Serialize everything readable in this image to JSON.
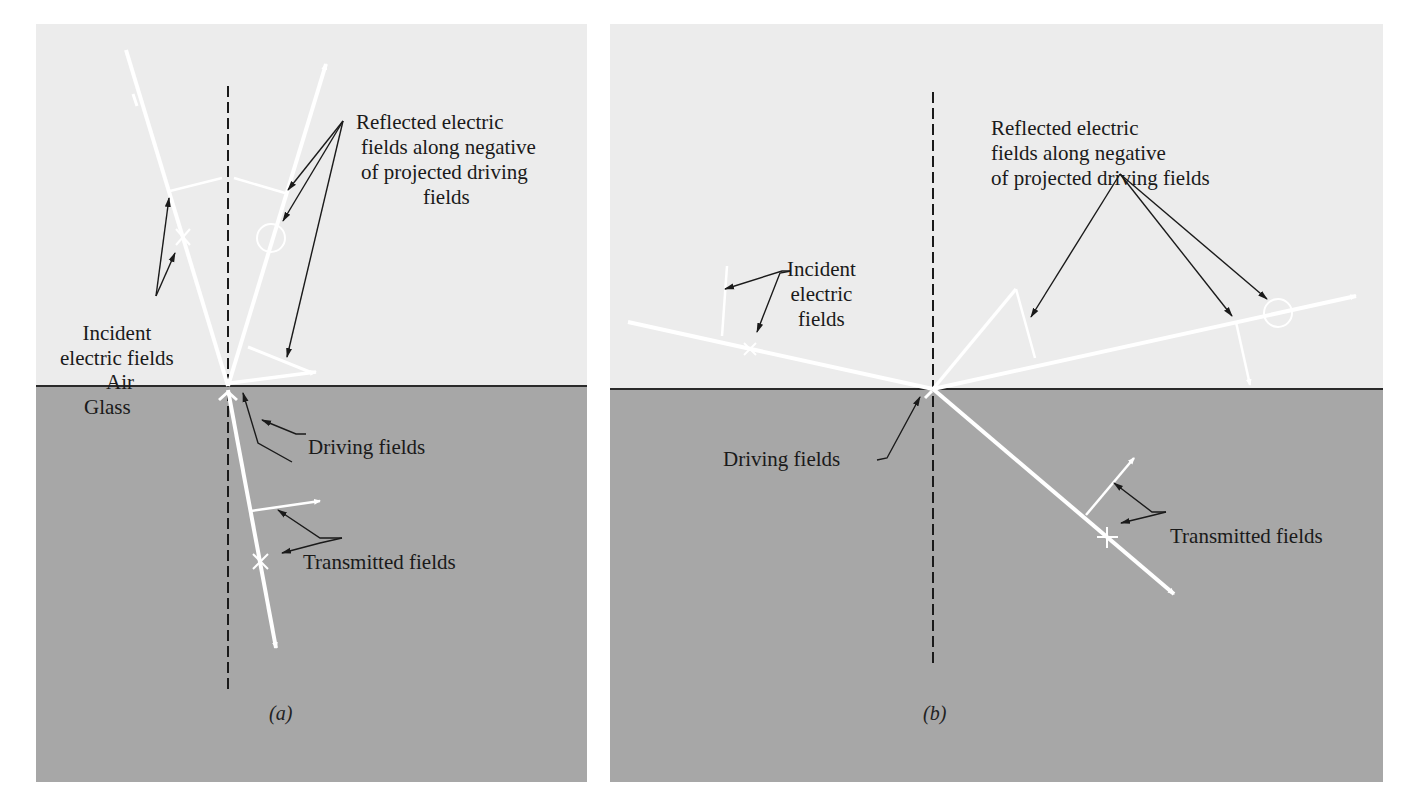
{
  "figure": {
    "panels": [
      {
        "id": "a",
        "caption": "(a)",
        "medium_top": "Air",
        "medium_bottom": "Glass",
        "labels": {
          "reflected": [
            "Reflected electric",
            "fields along negative",
            "of projected driving",
            "fields"
          ],
          "incident": [
            "Incident",
            "electric fields"
          ],
          "driving": "Driving fields",
          "transmitted": "Transmitted fields"
        }
      },
      {
        "id": "b",
        "caption": "(b)",
        "labels": {
          "reflected": [
            "Reflected electric",
            "fields along negative",
            "of projected driving fields"
          ],
          "incident": [
            "Incident",
            "electric",
            "fields"
          ],
          "driving": "Driving fields",
          "transmitted": "Transmitted fields"
        }
      }
    ],
    "colors": {
      "air": "#ececec",
      "glass": "#a7a7a7",
      "ray": "#ffffff",
      "leader": "#1a1a1a"
    }
  }
}
